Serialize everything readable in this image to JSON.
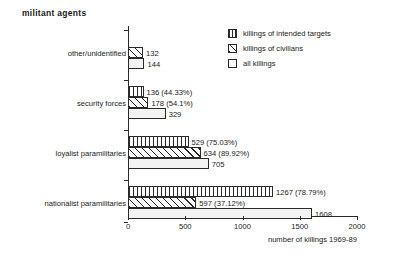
{
  "chart_data": {
    "type": "bar",
    "orientation": "horizontal",
    "title": "militant agents",
    "xlabel": "number of killings 1969-89",
    "ylabel": "",
    "xlim": [
      0,
      2000
    ],
    "xticks": [
      0,
      500,
      1000,
      1500,
      2000
    ],
    "xtick_labels": [
      "0",
      "500",
      "1000",
      "1500",
      "2000"
    ],
    "grid": false,
    "legend_position": "top-right",
    "categories": [
      "other/unidentified",
      "security forces",
      "loyalist paramilitaries",
      "nationalist paramilitaries"
    ],
    "series": [
      {
        "name": "killings of intended targets",
        "pattern": "vertical-hatch",
        "values": [
          null,
          136,
          529,
          1267
        ],
        "labels": [
          "",
          "136 (44.33%)",
          "529  (75.03%)",
          "1267 (78.79%)"
        ]
      },
      {
        "name": "killings of civilians",
        "pattern": "diagonal-hatch",
        "values": [
          132,
          178,
          634,
          597
        ],
        "labels": [
          "132",
          "178 (54.1%)",
          "634 (89.92%)",
          "597  (37.12%)"
        ]
      },
      {
        "name": "all killings",
        "pattern": "empty",
        "values": [
          144,
          329,
          705,
          1608
        ],
        "labels": [
          "144",
          "329",
          "705",
          "1608"
        ]
      }
    ]
  },
  "legend": {
    "items": [
      {
        "label": "killings of intended targets",
        "pattern": "vertical-hatch"
      },
      {
        "label": "killings of civilians",
        "pattern": "diagonal-hatch"
      },
      {
        "label": "all killings",
        "pattern": "empty"
      }
    ]
  },
  "colors": {
    "ink": "#2a2a2a",
    "background": "#ffffff",
    "bar_fill": "#f3f3f3"
  }
}
